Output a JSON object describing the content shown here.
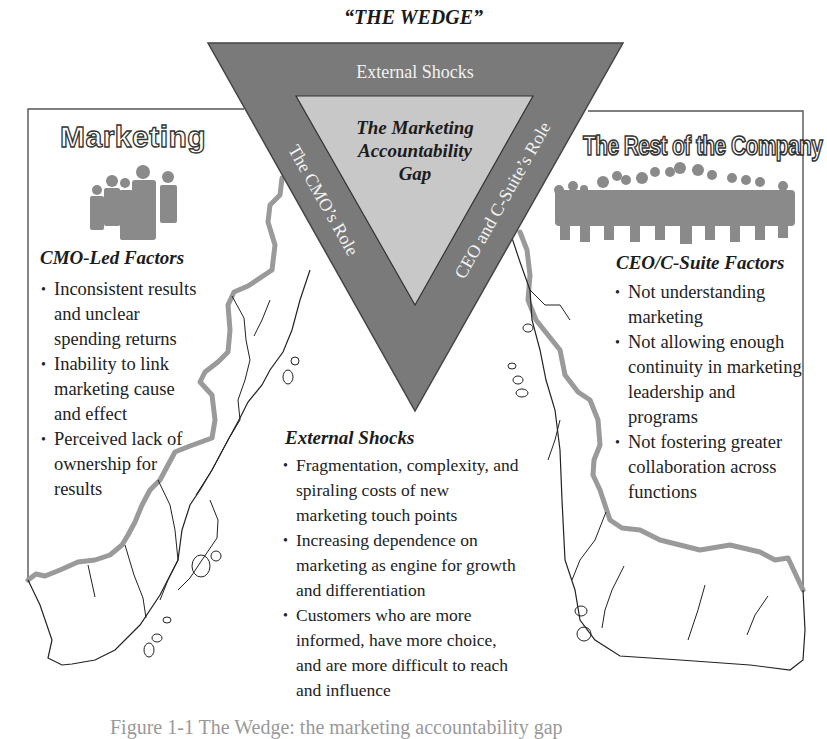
{
  "title": "“THE WEDGE”",
  "wedge": {
    "top_label": "External Shocks",
    "left_label": "The CMO’s Role",
    "right_label": "CEO and C-Suite’s Role",
    "center_title_lines": [
      "The Marketing",
      "Accountability",
      "Gap"
    ],
    "colors": {
      "outer": "#7a7a7a",
      "inner": "#c8c8c8",
      "coastline": "#9a9a9a"
    }
  },
  "left_panel": {
    "title": "Marketing",
    "icon": "people-group-icon",
    "section_heading": "CMO-Led Factors",
    "bullets": [
      "Inconsistent results and unclear spending returns",
      "Inability to link marketing cause and effect",
      "Perceived lack of ownership for results"
    ]
  },
  "right_panel": {
    "title": "The Rest of the Company",
    "icon": "crowd-icon",
    "section_heading": "CEO/C-Suite Factors",
    "bullets": [
      "Not understanding marketing",
      "Not allowing enough continuity in marketing leadership and programs",
      "Not fostering greater collaboration across functions"
    ]
  },
  "center_section": {
    "section_heading": "External Shocks",
    "bullets": [
      "Fragmentation, complexity, and spiraling costs of new marketing touch points",
      "Increasing dependence on marketing as engine for growth and differentiation",
      "Customers who are more informed, have more choice, and are more difficult to reach and influence"
    ]
  },
  "caption": "Figure 1-1  The Wedge: the marketing accountability gap"
}
